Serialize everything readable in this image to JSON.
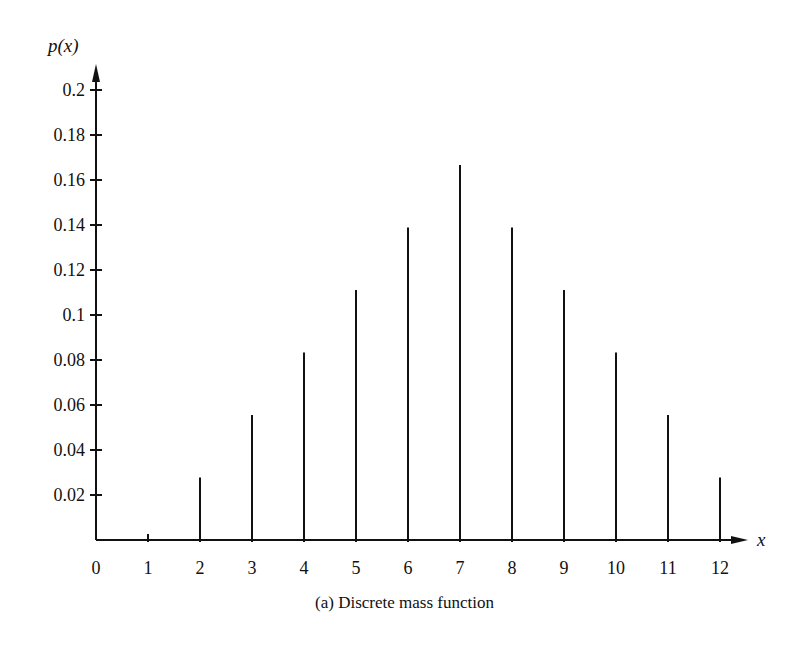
{
  "chart_data": {
    "type": "bar",
    "subtype": "stem",
    "title": "(a) Discrete mass function",
    "xlabel": "x",
    "ylabel": "p(x)",
    "x": [
      0,
      1,
      2,
      3,
      4,
      5,
      6,
      7,
      8,
      9,
      10,
      11,
      12
    ],
    "values": [
      0,
      0,
      0.0278,
      0.0556,
      0.0833,
      0.1111,
      0.1389,
      0.1667,
      0.1389,
      0.1111,
      0.0833,
      0.0556,
      0.0278
    ],
    "xticks": [
      "0",
      "1",
      "2",
      "3",
      "4",
      "5",
      "6",
      "7",
      "8",
      "9",
      "10",
      "11",
      "12"
    ],
    "yticks": [
      "0.02",
      "0.04",
      "0.06",
      "0.08",
      "0.1",
      "0.12",
      "0.14",
      "0.16",
      "0.18",
      "0.2"
    ],
    "xlim": [
      0,
      12
    ],
    "ylim": [
      0,
      0.2
    ],
    "grid": false,
    "legend": null
  },
  "caption": "(a) Discrete mass function",
  "axis_labels": {
    "y": "p(x)",
    "x": "x"
  }
}
